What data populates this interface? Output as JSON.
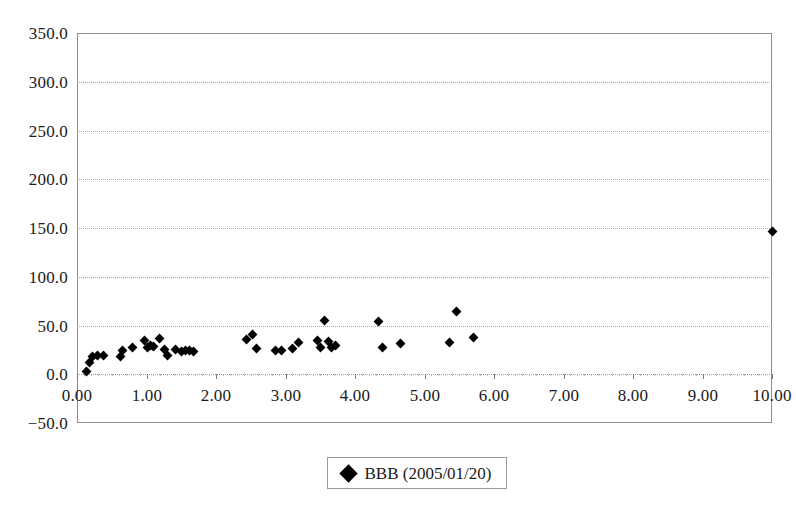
{
  "chart_data": {
    "type": "scatter",
    "title": "",
    "xlabel": "",
    "ylabel": "",
    "xlim": [
      0.0,
      10.0
    ],
    "ylim": [
      -50.0,
      350.0
    ],
    "grid": true,
    "legend_position": "bottom-center",
    "y_ticks": [
      "350.0",
      "300.0",
      "250.0",
      "200.0",
      "150.0",
      "100.0",
      "50.0",
      "0.0",
      "-50.0"
    ],
    "y_tick_values": [
      350.0,
      300.0,
      250.0,
      200.0,
      150.0,
      100.0,
      50.0,
      0.0,
      -50.0
    ],
    "x_ticks": [
      "0.00",
      "1.00",
      "2.00",
      "3.00",
      "4.00",
      "5.00",
      "6.00",
      "7.00",
      "8.00",
      "9.00",
      "10.00"
    ],
    "x_tick_values": [
      0.0,
      1.0,
      2.0,
      3.0,
      4.0,
      5.0,
      6.0,
      7.0,
      8.0,
      9.0,
      10.0
    ],
    "marker_shape": "diamond",
    "marker_color": "#000000",
    "series": [
      {
        "name": "BBB (2005/01/20)",
        "points": [
          [
            0.14,
            3.0
          ],
          [
            0.18,
            12.0
          ],
          [
            0.22,
            18.0
          ],
          [
            0.3,
            19.0
          ],
          [
            0.38,
            19.0
          ],
          [
            0.62,
            18.0
          ],
          [
            0.66,
            24.0
          ],
          [
            0.8,
            28.0
          ],
          [
            0.97,
            35.0
          ],
          [
            1.02,
            27.0
          ],
          [
            1.05,
            30.0
          ],
          [
            1.1,
            29.0
          ],
          [
            1.18,
            37.0
          ],
          [
            1.26,
            25.0
          ],
          [
            1.3,
            19.0
          ],
          [
            1.42,
            25.0
          ],
          [
            1.5,
            23.0
          ],
          [
            1.56,
            24.0
          ],
          [
            1.62,
            24.0
          ],
          [
            1.68,
            23.0
          ],
          [
            2.44,
            36.0
          ],
          [
            2.52,
            41.0
          ],
          [
            2.58,
            26.0
          ],
          [
            2.86,
            24.0
          ],
          [
            2.94,
            24.0
          ],
          [
            3.1,
            26.0
          ],
          [
            3.18,
            33.0
          ],
          [
            3.46,
            35.0
          ],
          [
            3.5,
            27.0
          ],
          [
            3.56,
            55.0
          ],
          [
            3.62,
            34.0
          ],
          [
            3.66,
            27.0
          ],
          [
            3.72,
            30.0
          ],
          [
            4.34,
            54.0
          ],
          [
            4.4,
            28.0
          ],
          [
            4.66,
            32.0
          ],
          [
            5.36,
            33.0
          ],
          [
            5.46,
            64.0
          ],
          [
            5.7,
            38.0
          ],
          [
            10.0,
            146.0
          ]
        ]
      }
    ]
  },
  "legend": {
    "label": "BBB (2005/01/20)",
    "marker_icon": "diamond-marker-icon"
  }
}
